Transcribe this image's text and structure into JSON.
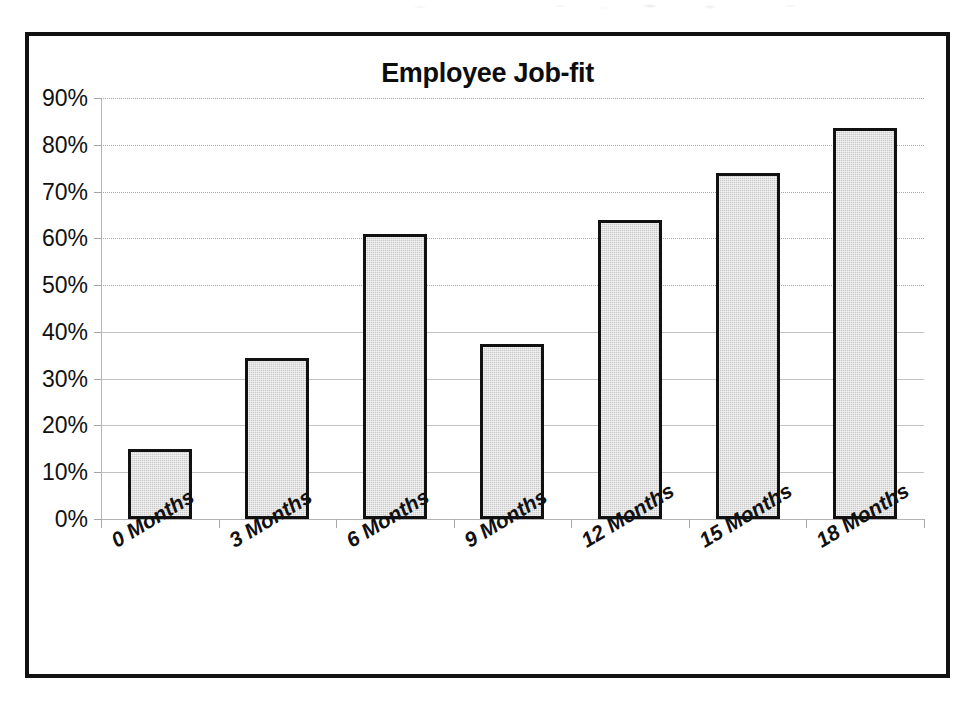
{
  "chart_data": {
    "type": "bar",
    "title": "Employee Job-fit",
    "xlabel": "",
    "ylabel": "",
    "categories": [
      "0 Months",
      "3 Months",
      "6 Months",
      "9 Months",
      "12 Months",
      "15 Months",
      "18 Months"
    ],
    "values": [
      15,
      34.5,
      61,
      37.5,
      64,
      74,
      83.5
    ],
    "ylim": [
      0,
      90
    ],
    "ytick_labels": [
      "90%",
      "80%",
      "70%",
      "60%",
      "50%",
      "40%",
      "30%",
      "20%",
      "10%",
      "0%"
    ],
    "ytick_values": [
      90,
      80,
      70,
      60,
      50,
      40,
      30,
      20,
      10,
      0
    ],
    "value_format": "percent",
    "grid": true,
    "legend": false,
    "legend_position": "none",
    "series": [
      {
        "name": "Job-fit",
        "values": [
          15,
          34.5,
          61,
          37.5,
          64,
          74,
          83.5
        ]
      }
    ],
    "colors": {
      "bar_fill": "#cacaca",
      "bar_border": "#111111",
      "frame": "#111111",
      "gridline": "#9a9a9a",
      "text": "#111111",
      "background": "#ffffff"
    }
  }
}
